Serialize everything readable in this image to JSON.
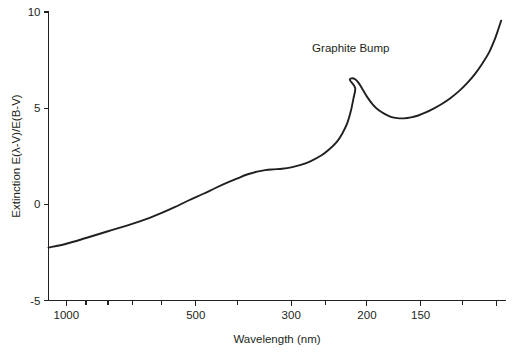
{
  "chart_data": {
    "type": "line",
    "title": "",
    "xlabel": "Wavelength (nm)",
    "ylabel": "Extinction E(λ-V)/E(B-V)",
    "xscale": "log-reversed",
    "xlim": [
      1100,
      95
    ],
    "ylim": [
      -5,
      10
    ],
    "grid": false,
    "legend": "none",
    "x_ticks_major": [
      {
        "value": 1000,
        "label": "1000"
      },
      {
        "value": 500,
        "label": "500"
      },
      {
        "value": 300,
        "label": "300"
      },
      {
        "value": 200,
        "label": "200"
      },
      {
        "value": 150,
        "label": "150"
      },
      {
        "value": 100,
        "label": ""
      }
    ],
    "x_ticks_minor": [
      900,
      800,
      700,
      600,
      400,
      250,
      120
    ],
    "y_ticks": [
      {
        "value": 10,
        "label": "10"
      },
      {
        "value": 5,
        "label": "5"
      },
      {
        "value": 0,
        "label": "0"
      },
      {
        "value": -5,
        "label": "-5"
      }
    ],
    "annotations": [
      {
        "text": "Graphite Bump",
        "x": 218,
        "y": 7.9
      }
    ],
    "series": [
      {
        "name": "Average interstellar extinction curve",
        "points": [
          [
            1100,
            -2.25
          ],
          [
            1000,
            -2.05
          ],
          [
            900,
            -1.75
          ],
          [
            800,
            -1.4
          ],
          [
            700,
            -1.0
          ],
          [
            640,
            -0.7
          ],
          [
            600,
            -0.45
          ],
          [
            560,
            -0.15
          ],
          [
            520,
            0.2
          ],
          [
            480,
            0.55
          ],
          [
            450,
            0.85
          ],
          [
            420,
            1.15
          ],
          [
            400,
            1.35
          ],
          [
            380,
            1.55
          ],
          [
            360,
            1.7
          ],
          [
            345,
            1.78
          ],
          [
            330,
            1.82
          ],
          [
            315,
            1.85
          ],
          [
            300,
            1.92
          ],
          [
            285,
            2.05
          ],
          [
            270,
            2.25
          ],
          [
            255,
            2.55
          ],
          [
            245,
            2.85
          ],
          [
            235,
            3.25
          ],
          [
            228,
            3.7
          ],
          [
            222,
            4.25
          ],
          [
            218,
            4.85
          ],
          [
            215,
            5.5
          ],
          [
            213,
            6.05
          ],
          [
            219,
            6.45
          ],
          [
            217,
            6.55
          ],
          [
            213,
            6.5
          ],
          [
            209,
            6.3
          ],
          [
            205,
            6.0
          ],
          [
            200,
            5.6
          ],
          [
            194,
            5.2
          ],
          [
            188,
            4.9
          ],
          [
            182,
            4.7
          ],
          [
            176,
            4.55
          ],
          [
            170,
            4.48
          ],
          [
            164,
            4.47
          ],
          [
            158,
            4.52
          ],
          [
            152,
            4.62
          ],
          [
            146,
            4.78
          ],
          [
            140,
            4.98
          ],
          [
            134,
            5.22
          ],
          [
            128,
            5.52
          ],
          [
            122,
            5.9
          ],
          [
            117,
            6.3
          ],
          [
            112,
            6.8
          ],
          [
            108,
            7.3
          ],
          [
            104,
            7.9
          ],
          [
            101,
            8.55
          ],
          [
            99,
            9.1
          ],
          [
            97.5,
            9.55
          ]
        ]
      }
    ]
  },
  "axes": {
    "y_axis_title": "Extinction E(λ-V)/E(B-V)",
    "x_axis_title": "Wavelength (nm)"
  },
  "annotation": {
    "graphite_bump": "Graphite Bump"
  }
}
